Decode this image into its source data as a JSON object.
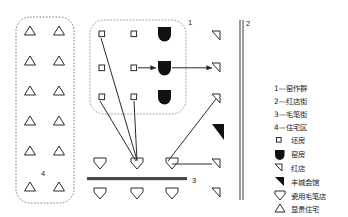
{
  "figure": {
    "background_color": "#ffffff",
    "stroke_color": "#2b2b2b",
    "fill_color": "#111111"
  },
  "zone_labels": [
    {
      "id": "zone-1",
      "text": "1"
    },
    {
      "id": "zone-2",
      "text": "2"
    },
    {
      "id": "zone-3",
      "text": "3"
    },
    {
      "id": "zone-4",
      "text": "4"
    }
  ],
  "legend": {
    "numbered_items": [
      {
        "key": "1",
        "label": "1—窑作群"
      },
      {
        "key": "2",
        "label": "2—红店街"
      },
      {
        "key": "3",
        "label": "3—毛笔街"
      },
      {
        "key": "4",
        "label": "4—住宅区"
      }
    ],
    "symbol_items": [
      {
        "icon": "small-square-icon",
        "label": "坯房"
      },
      {
        "icon": "filled-shield-icon",
        "label": "窑房"
      },
      {
        "icon": "small-right-triangle-outline-icon",
        "label": "红店"
      },
      {
        "icon": "filled-right-triangle-icon",
        "label": "丰城会馆"
      },
      {
        "icon": "down-triangle-outline-icon",
        "label": "瓷用毛笔店"
      },
      {
        "icon": "up-triangle-outline-icon",
        "label": "显贵住宅"
      }
    ]
  },
  "areas": {
    "residential_zone": {
      "name": "住宅区",
      "number": "4",
      "rows": 6,
      "cols": 2,
      "symbol": "up-triangle-outline-icon"
    },
    "kiln_cluster": {
      "name": "窑作群",
      "number": "1",
      "rows": 3,
      "cols": 3,
      "symbols": [
        "small-square-icon",
        "small-square-icon",
        "filled-shield-icon"
      ]
    },
    "red_shop_street": {
      "name": "红店街",
      "number": "2",
      "outline_triangles": 5,
      "filled_triangles": 1
    },
    "brush_street": {
      "name": "毛笔街",
      "number": "3",
      "down_triangles_above": 3,
      "down_triangles_below": 3
    }
  }
}
